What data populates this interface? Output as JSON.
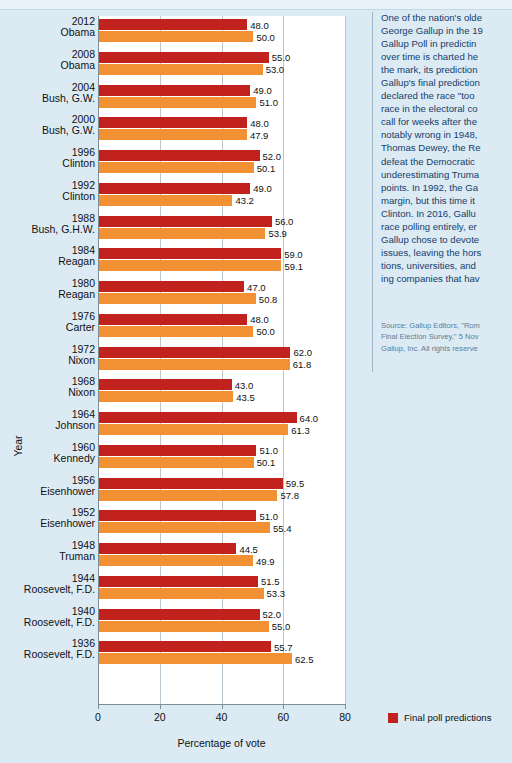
{
  "colors": {
    "prediction": "#c2221d",
    "actual": "#f29133",
    "page_background": "#dceaf4",
    "plot_background": "#ffffff",
    "side_text": "#13406b"
  },
  "chart_data": {
    "type": "bar",
    "orientation": "horizontal",
    "title": "",
    "xlabel": "Percentage of vote",
    "ylabel": "Year",
    "xlim": [
      0,
      80
    ],
    "xticks": [
      0,
      20,
      40,
      60,
      80
    ],
    "grid": true,
    "legend_position": "bottom-right",
    "series": [
      {
        "name": "Final poll predictions",
        "color": "#c2221d",
        "values": [
          48.0,
          55.0,
          49.0,
          48.0,
          52.0,
          49.0,
          56.0,
          59.0,
          47.0,
          48.0,
          62.0,
          43.0,
          64.0,
          51.0,
          59.5,
          51.0,
          44.5,
          51.5,
          52.0,
          55.7
        ]
      },
      {
        "name": "Election result",
        "color": "#f29133",
        "values": [
          50.0,
          53.0,
          51.0,
          47.9,
          50.1,
          43.2,
          53.9,
          59.1,
          50.8,
          50.0,
          61.8,
          43.5,
          61.3,
          50.1,
          57.8,
          55.4,
          49.9,
          53.3,
          55.0,
          62.5
        ]
      }
    ],
    "categories": [
      {
        "year": "2012",
        "name": "Obama"
      },
      {
        "year": "2008",
        "name": "Obama"
      },
      {
        "year": "2004",
        "name": "Bush, G.W."
      },
      {
        "year": "2000",
        "name": "Bush, G.W."
      },
      {
        "year": "1996",
        "name": "Clinton"
      },
      {
        "year": "1992",
        "name": "Clinton"
      },
      {
        "year": "1988",
        "name": "Bush, G.H.W."
      },
      {
        "year": "1984",
        "name": "Reagan"
      },
      {
        "year": "1980",
        "name": "Reagan"
      },
      {
        "year": "1976",
        "name": "Carter"
      },
      {
        "year": "1972",
        "name": "Nixon"
      },
      {
        "year": "1968",
        "name": "Nixon"
      },
      {
        "year": "1964",
        "name": "Johnson"
      },
      {
        "year": "1960",
        "name": "Kennedy"
      },
      {
        "year": "1956",
        "name": "Eisenhower"
      },
      {
        "year": "1952",
        "name": "Eisenhower"
      },
      {
        "year": "1948",
        "name": "Truman"
      },
      {
        "year": "1944",
        "name": "Roosevelt, F.D."
      },
      {
        "year": "1940",
        "name": "Roosevelt, F.D."
      },
      {
        "year": "1936",
        "name": "Roosevelt, F.D."
      }
    ],
    "value_labels": {
      "2012": {
        "prediction": "48.0",
        "actual": "50.0"
      },
      "2008": {
        "prediction": "55.0",
        "actual": "53.0"
      },
      "2004": {
        "prediction": "49.0",
        "actual": "51.0"
      },
      "2000": {
        "prediction": "48.0",
        "actual": "47.9"
      },
      "1996": {
        "prediction": "52.0",
        "actual": "50.1"
      },
      "1992": {
        "prediction": "49.0",
        "actual": "43.2"
      },
      "1988": {
        "prediction": "56.0",
        "actual": "53.9"
      },
      "1984": {
        "prediction": "59.0",
        "actual": "59.1"
      },
      "1980": {
        "prediction": "47.0",
        "actual": "50.8"
      },
      "1976": {
        "prediction": "48.0",
        "actual": "50.0"
      },
      "1972": {
        "prediction": "62.0",
        "actual": "61.8"
      },
      "1968": {
        "prediction": "43.0",
        "actual": "43.5"
      },
      "1964": {
        "prediction": "64.0",
        "actual": "61.3"
      },
      "1960": {
        "prediction": "51.0",
        "actual": "50.1"
      },
      "1956": {
        "prediction": "59.5",
        "actual": "57.8"
      },
      "1952": {
        "prediction": "51.0",
        "actual": "55.4"
      },
      "1948": {
        "prediction": "44.5",
        "actual": "49.9"
      },
      "1944": {
        "prediction": "51.5",
        "actual": "53.3"
      },
      "1940": {
        "prediction": "52.0",
        "actual": "55.0"
      },
      "1936": {
        "prediction": "55.7",
        "actual": "62.5"
      }
    }
  },
  "axis": {
    "x_title": "Percentage of vote",
    "y_title": "Year",
    "x_tick_labels": [
      "0",
      "20",
      "40",
      "60",
      "80"
    ]
  },
  "legend": {
    "items": [
      {
        "label": "Final poll predictions",
        "color": "#c2221d"
      }
    ]
  },
  "sidebar": {
    "body_lines": [
      "One of the nation's olde",
      "George Gallup in the 19",
      "Gallup Poll in predictin",
      "over time is charted he",
      "the mark, its prediction",
      "Gallup's final prediction",
      "declared the race \"too ",
      "race in the electoral co",
      "call for weeks after the",
      "notably wrong in 1948,",
      "Thomas Dewey, the Re",
      "defeat the Democratic ",
      "underestimating Truma",
      "points. In 1992, the Ga",
      "margin, but this time it",
      "Clinton. In 2016, Gallu",
      "race polling entirely, er",
      "Gallup chose to devote",
      "issues, leaving the hors",
      "tions, universities, and",
      "ing companies that hav"
    ],
    "source_lines": [
      "Source: Gallup Editors, \"Rom",
      "Final Election Survey,\" 5 Nov",
      "Gallup, Inc. All rights reserve"
    ]
  }
}
